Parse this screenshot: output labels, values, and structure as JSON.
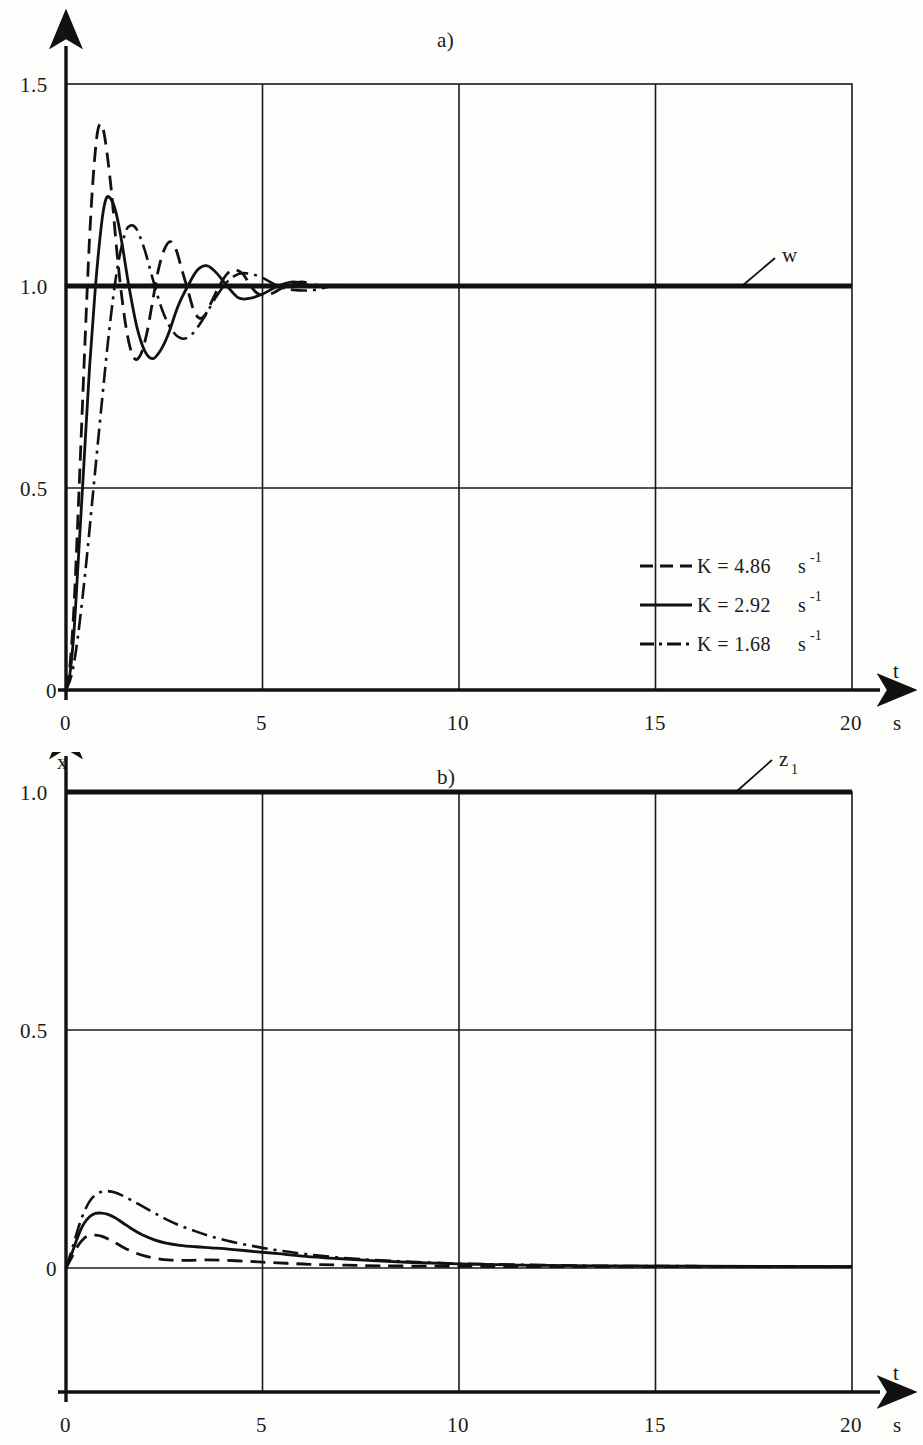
{
  "figure": {
    "panel_a_label": "a)",
    "panel_b_label": "b)"
  },
  "chart_data": [
    {
      "type": "line",
      "panel": "a)",
      "title": "a)",
      "xlabel": "t",
      "xunit": "s",
      "ylabel": "x",
      "xlim": [
        0,
        20
      ],
      "ylim": [
        0,
        1.5
      ],
      "xticks": [
        0,
        5,
        10,
        15,
        20
      ],
      "xticklabels": [
        "0",
        "5",
        "10",
        "15",
        "20"
      ],
      "yticks": [
        0,
        0.5,
        1.0,
        1.5
      ],
      "yticklabels": [
        "0",
        "0.5",
        "1.0",
        "1.5"
      ],
      "grid": true,
      "legend_position": "lower-right-inside",
      "annotations": [
        {
          "text": "w",
          "value": 1.0,
          "description": "setpoint reference line at x = 1.0"
        }
      ],
      "reference_line": {
        "label": "w",
        "y": 1.0
      },
      "series": [
        {
          "name": "K = 4.86 s⁻¹",
          "K": 4.86,
          "unit": "s^-1",
          "style": "dashed",
          "overshoot_peak": 1.4,
          "peak_time": 0.85,
          "points": [
            [
              0.0,
              0.0
            ],
            [
              0.1,
              0.06
            ],
            [
              0.2,
              0.2
            ],
            [
              0.3,
              0.42
            ],
            [
              0.4,
              0.66
            ],
            [
              0.5,
              0.9
            ],
            [
              0.6,
              1.12
            ],
            [
              0.7,
              1.28
            ],
            [
              0.8,
              1.38
            ],
            [
              0.9,
              1.4
            ],
            [
              1.0,
              1.36
            ],
            [
              1.15,
              1.24
            ],
            [
              1.3,
              1.08
            ],
            [
              1.45,
              0.95
            ],
            [
              1.6,
              0.86
            ],
            [
              1.75,
              0.82
            ],
            [
              1.9,
              0.83
            ],
            [
              2.05,
              0.88
            ],
            [
              2.2,
              0.96
            ],
            [
              2.35,
              1.04
            ],
            [
              2.5,
              1.09
            ],
            [
              2.65,
              1.11
            ],
            [
              2.8,
              1.09
            ],
            [
              2.95,
              1.04
            ],
            [
              3.1,
              0.99
            ],
            [
              3.25,
              0.94
            ],
            [
              3.4,
              0.92
            ],
            [
              3.55,
              0.93
            ],
            [
              3.7,
              0.96
            ],
            [
              3.9,
              1.0
            ],
            [
              4.1,
              1.03
            ],
            [
              4.3,
              1.04
            ],
            [
              4.5,
              1.03
            ],
            [
              4.7,
              1.0
            ],
            [
              4.9,
              0.98
            ],
            [
              5.2,
              0.98
            ],
            [
              5.6,
              1.0
            ],
            [
              6.0,
              1.01
            ],
            [
              6.5,
              1.0
            ],
            [
              7.0,
              1.0
            ],
            [
              8.0,
              1.0
            ],
            [
              10.0,
              1.0
            ],
            [
              13.0,
              1.0
            ],
            [
              16.0,
              1.0
            ],
            [
              20.0,
              1.0
            ]
          ]
        },
        {
          "name": "K = 2.92 s⁻¹",
          "K": 2.92,
          "unit": "s^-1",
          "style": "solid",
          "overshoot_peak": 1.22,
          "peak_time": 1.0,
          "points": [
            [
              0.0,
              0.0
            ],
            [
              0.1,
              0.04
            ],
            [
              0.2,
              0.14
            ],
            [
              0.3,
              0.3
            ],
            [
              0.45,
              0.55
            ],
            [
              0.6,
              0.8
            ],
            [
              0.75,
              1.0
            ],
            [
              0.9,
              1.15
            ],
            [
              1.0,
              1.21
            ],
            [
              1.1,
              1.22
            ],
            [
              1.25,
              1.19
            ],
            [
              1.4,
              1.12
            ],
            [
              1.6,
              1.0
            ],
            [
              1.8,
              0.9
            ],
            [
              2.0,
              0.84
            ],
            [
              2.2,
              0.82
            ],
            [
              2.4,
              0.84
            ],
            [
              2.6,
              0.88
            ],
            [
              2.85,
              0.95
            ],
            [
              3.1,
              1.0
            ],
            [
              3.35,
              1.04
            ],
            [
              3.6,
              1.05
            ],
            [
              3.85,
              1.03
            ],
            [
              4.1,
              1.0
            ],
            [
              4.4,
              0.97
            ],
            [
              4.7,
              0.97
            ],
            [
              5.0,
              0.98
            ],
            [
              5.4,
              1.0
            ],
            [
              5.8,
              1.01
            ],
            [
              6.3,
              1.0
            ],
            [
              7.0,
              1.0
            ],
            [
              8.0,
              1.0
            ],
            [
              10.0,
              1.0
            ],
            [
              14.0,
              1.0
            ],
            [
              20.0,
              1.0
            ]
          ]
        },
        {
          "name": "K = 1.68 s⁻¹",
          "K": 1.68,
          "unit": "s^-1",
          "style": "dashdot",
          "overshoot_peak": 1.15,
          "peak_time": 1.45,
          "points": [
            [
              0.0,
              0.0
            ],
            [
              0.15,
              0.04
            ],
            [
              0.3,
              0.13
            ],
            [
              0.5,
              0.3
            ],
            [
              0.7,
              0.5
            ],
            [
              0.9,
              0.7
            ],
            [
              1.1,
              0.89
            ],
            [
              1.3,
              1.04
            ],
            [
              1.5,
              1.13
            ],
            [
              1.65,
              1.15
            ],
            [
              1.8,
              1.14
            ],
            [
              2.0,
              1.09
            ],
            [
              2.2,
              1.02
            ],
            [
              2.45,
              0.94
            ],
            [
              2.7,
              0.89
            ],
            [
              2.95,
              0.87
            ],
            [
              3.2,
              0.88
            ],
            [
              3.5,
              0.92
            ],
            [
              3.8,
              0.97
            ],
            [
              4.1,
              1.01
            ],
            [
              4.4,
              1.03
            ],
            [
              4.7,
              1.03
            ],
            [
              5.0,
              1.02
            ],
            [
              5.4,
              1.0
            ],
            [
              5.8,
              0.99
            ],
            [
              6.3,
              0.99
            ],
            [
              6.8,
              1.0
            ],
            [
              7.5,
              1.0
            ],
            [
              9.0,
              1.0
            ],
            [
              12.0,
              1.0
            ],
            [
              16.0,
              1.0
            ],
            [
              20.0,
              1.0
            ]
          ]
        }
      ]
    },
    {
      "type": "line",
      "panel": "b)",
      "title": "b)",
      "xlabel": "t",
      "xunit": "s",
      "ylabel": "x",
      "xlim": [
        0,
        20
      ],
      "ylim": [
        0,
        1.3
      ],
      "xticks": [
        0,
        5,
        10,
        15,
        20
      ],
      "xticklabels": [
        "0",
        "5",
        "10",
        "15",
        "20"
      ],
      "yticks": [
        0,
        0.5,
        1.0
      ],
      "yticklabels": [
        "0",
        "0.5",
        "1.0"
      ],
      "grid": true,
      "annotations": [
        {
          "text": "z1",
          "value": 1.0,
          "description": "disturbance step line at x = 1.0"
        }
      ],
      "reference_line": {
        "label": "z1",
        "y": 1.0
      },
      "series": [
        {
          "name": "K = 4.86 s⁻¹",
          "K": 4.86,
          "unit": "s^-1",
          "style": "dashed",
          "peak": 0.09,
          "peak_time": 0.72,
          "points": [
            [
              0.0,
              0.0
            ],
            [
              0.15,
              0.03
            ],
            [
              0.3,
              0.06
            ],
            [
              0.45,
              0.08
            ],
            [
              0.6,
              0.089
            ],
            [
              0.75,
              0.09
            ],
            [
              0.9,
              0.087
            ],
            [
              1.1,
              0.078
            ],
            [
              1.3,
              0.066
            ],
            [
              1.5,
              0.054
            ],
            [
              1.75,
              0.042
            ],
            [
              2.0,
              0.033
            ],
            [
              2.3,
              0.026
            ],
            [
              2.6,
              0.022
            ],
            [
              2.9,
              0.021
            ],
            [
              3.2,
              0.021
            ],
            [
              3.6,
              0.022
            ],
            [
              4.0,
              0.021
            ],
            [
              4.5,
              0.019
            ],
            [
              5.0,
              0.016
            ],
            [
              5.6,
              0.013
            ],
            [
              6.2,
              0.01
            ],
            [
              7.0,
              0.008
            ],
            [
              8.0,
              0.006
            ],
            [
              9.5,
              0.005
            ],
            [
              11.0,
              0.004
            ],
            [
              13.0,
              0.004
            ],
            [
              16.0,
              0.004
            ],
            [
              20.0,
              0.004
            ]
          ]
        },
        {
          "name": "K = 2.92 s⁻¹",
          "K": 2.92,
          "unit": "s^-1",
          "style": "solid",
          "peak": 0.15,
          "peak_time": 0.85,
          "points": [
            [
              0.0,
              0.0
            ],
            [
              0.15,
              0.04
            ],
            [
              0.3,
              0.085
            ],
            [
              0.45,
              0.12
            ],
            [
              0.6,
              0.14
            ],
            [
              0.75,
              0.149
            ],
            [
              0.9,
              0.15
            ],
            [
              1.05,
              0.147
            ],
            [
              1.25,
              0.137
            ],
            [
              1.45,
              0.123
            ],
            [
              1.7,
              0.105
            ],
            [
              1.95,
              0.09
            ],
            [
              2.25,
              0.077
            ],
            [
              2.55,
              0.068
            ],
            [
              2.9,
              0.062
            ],
            [
              3.3,
              0.058
            ],
            [
              3.7,
              0.055
            ],
            [
              4.2,
              0.051
            ],
            [
              4.8,
              0.045
            ],
            [
              5.4,
              0.039
            ],
            [
              6.1,
              0.032
            ],
            [
              6.9,
              0.026
            ],
            [
              7.8,
              0.02
            ],
            [
              8.8,
              0.015
            ],
            [
              10.0,
              0.011
            ],
            [
              11.5,
              0.008
            ],
            [
              13.5,
              0.006
            ],
            [
              16.0,
              0.005
            ],
            [
              20.0,
              0.004
            ]
          ]
        },
        {
          "name": "K = 1.68 s⁻¹",
          "K": 1.68,
          "unit": "s^-1",
          "style": "dashdot",
          "peak": 0.21,
          "peak_time": 0.95,
          "points": [
            [
              0.0,
              0.0
            ],
            [
              0.15,
              0.05
            ],
            [
              0.3,
              0.105
            ],
            [
              0.45,
              0.15
            ],
            [
              0.6,
              0.182
            ],
            [
              0.75,
              0.2
            ],
            [
              0.9,
              0.208
            ],
            [
              1.05,
              0.21
            ],
            [
              1.25,
              0.206
            ],
            [
              1.45,
              0.197
            ],
            [
              1.7,
              0.183
            ],
            [
              1.95,
              0.168
            ],
            [
              2.25,
              0.15
            ],
            [
              2.55,
              0.133
            ],
            [
              2.9,
              0.116
            ],
            [
              3.3,
              0.1
            ],
            [
              3.7,
              0.086
            ],
            [
              4.2,
              0.072
            ],
            [
              4.8,
              0.059
            ],
            [
              5.4,
              0.048
            ],
            [
              6.1,
              0.038
            ],
            [
              6.9,
              0.029
            ],
            [
              7.8,
              0.022
            ],
            [
              8.8,
              0.017
            ],
            [
              10.0,
              0.012
            ],
            [
              11.5,
              0.009
            ],
            [
              13.5,
              0.006
            ],
            [
              16.0,
              0.005
            ],
            [
              20.0,
              0.004
            ]
          ]
        }
      ],
      "legend_position": "none"
    }
  ],
  "panel_a": {
    "label": "a)",
    "y_axis_label": "x",
    "x_axis_label": "t",
    "x_axis_unit": "s",
    "yticklabels": [
      "0",
      "0.5",
      "1.0",
      "1.5"
    ],
    "xticklabels": [
      "0",
      "5",
      "10",
      "15",
      "20"
    ],
    "reference_label": "w",
    "legend": [
      {
        "style": "dashed",
        "label": "K = 4.86",
        "unit": "s",
        "exponent": "-1"
      },
      {
        "style": "solid",
        "label": "K = 2.92",
        "unit": "s",
        "exponent": "-1"
      },
      {
        "style": "dashdot",
        "label": "K = 1.68",
        "unit": "s",
        "exponent": "-1"
      }
    ]
  },
  "panel_b": {
    "label": "b)",
    "y_axis_label": "x",
    "x_axis_label": "t",
    "x_axis_unit": "s",
    "yticklabels": [
      "0",
      "0.5",
      "1.0"
    ],
    "xticklabels": [
      "0",
      "5",
      "10",
      "15",
      "20"
    ],
    "reference_label": "z",
    "reference_label_sub": "1"
  },
  "colors": {
    "ink": "#111111",
    "paper": "#fdfdfb",
    "grid": "#1a1a1a"
  }
}
